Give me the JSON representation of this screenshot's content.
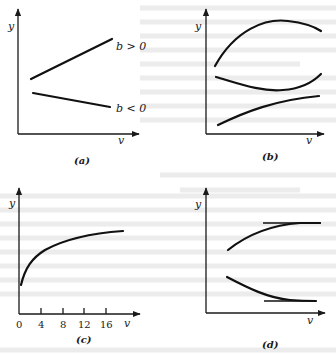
{
  "figure": {
    "panels": [
      {
        "id": "a",
        "caption": "(a)",
        "y_label": "y",
        "x_label": "v",
        "curves": [
          {
            "name": "line-b-positive",
            "label": "b > 0",
            "shape": "increasing straight line"
          },
          {
            "name": "line-b-negative",
            "label": "b < 0",
            "shape": "decreasing straight line"
          }
        ]
      },
      {
        "id": "b",
        "caption": "(b)",
        "y_label": "y",
        "x_label": "v",
        "curves": [
          {
            "name": "concave-down-curve",
            "shape": "arch with maximum"
          },
          {
            "name": "concave-up-curve",
            "shape": "trough with minimum"
          },
          {
            "name": "increasing-curve",
            "shape": "gently rising, concave down"
          }
        ]
      },
      {
        "id": "c",
        "caption": "(c)",
        "y_label": "y",
        "x_label": "v",
        "x_ticks": [
          "0",
          "4",
          "8",
          "12",
          "16"
        ],
        "curves": [
          {
            "name": "sqrt-like-curve",
            "shape": "steep rise then flattening (power < 1)"
          }
        ]
      },
      {
        "id": "d",
        "caption": "(d)",
        "y_label": "y",
        "x_label": "v",
        "curves": [
          {
            "name": "rising-to-asymptote",
            "shape": "increasing curve approaching upper horizontal asymptote"
          },
          {
            "name": "falling-to-asymptote",
            "shape": "decreasing curve approaching lower horizontal asymptote"
          }
        ],
        "asymptotes": [
          "upper horizontal line",
          "lower horizontal line"
        ]
      }
    ]
  },
  "labels": {
    "a_y": "y",
    "a_v": "v",
    "a_cap": "(a)",
    "a_bpos": "b > 0",
    "a_bneg": "b < 0",
    "b_y": "y",
    "b_v": "v",
    "b_cap": "(b)",
    "c_y": "y",
    "c_v": "v",
    "c_cap": "(c)",
    "c_t0": "0",
    "c_t4": "4",
    "c_t8": "8",
    "c_t12": "12",
    "c_t16": "16",
    "d_y": "y",
    "d_v": "v",
    "d_cap": "(d)"
  },
  "colors": {
    "ink": "#111111",
    "paper": "#ffffff",
    "show_through_text": "#d9d9d9"
  }
}
